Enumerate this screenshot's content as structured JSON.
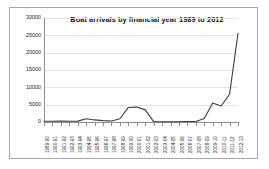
{
  "figure": {
    "title": "Boat arrivals by financial year 1989 to 2012",
    "border_color": "#a8a8a8",
    "background": "#ffffff",
    "line_color": "#3a3a3a",
    "grid_color": "#e2e2e2",
    "axis_color": "#8d8d8d"
  },
  "chart_data": {
    "type": "line",
    "title": "Boat arrivals by financial year 1989 to 2012",
    "xlabel": "",
    "ylabel": "",
    "ylim": [
      0,
      30000
    ],
    "yticks": [
      0,
      5000,
      10000,
      15000,
      20000,
      25000,
      30000
    ],
    "ytick_labels": [
      "0",
      "5000",
      "10000",
      "15000",
      "20000",
      "25000",
      "30000"
    ],
    "grid": true,
    "legend": false,
    "categories": [
      "1989-90",
      "1990-91",
      "1991-92",
      "1992-93",
      "1993-94",
      "1994-95",
      "1995-96",
      "1996-97",
      "1997-98",
      "1998-99",
      "1999-00",
      "2000-01",
      "2001-02",
      "2002-03",
      "2003-04",
      "2004-05",
      "2005-06",
      "2006-07",
      "2007-08",
      "2008-09",
      "2009-10",
      "2010-11",
      "2011-12",
      "2012-13"
    ],
    "values": [
      200,
      220,
      250,
      200,
      250,
      950,
      600,
      400,
      300,
      950,
      4200,
      4300,
      3500,
      100,
      80,
      60,
      60,
      130,
      150,
      1000,
      5500,
      4600,
      8000,
      25600
    ],
    "series": [
      {
        "name": "Boat arrivals",
        "values": [
          200,
          220,
          250,
          200,
          250,
          950,
          600,
          400,
          300,
          950,
          4200,
          4300,
          3500,
          100,
          80,
          60,
          60,
          130,
          150,
          1000,
          5500,
          4600,
          8000,
          25600
        ]
      }
    ]
  }
}
